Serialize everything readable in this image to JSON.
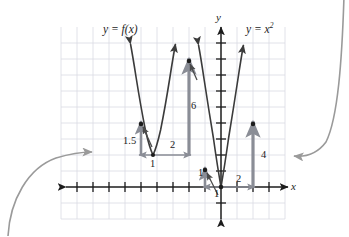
{
  "figure": {
    "kind": "math-graph",
    "background_color": "#ffffff",
    "grid_color": "#d9dbe3",
    "axis_color": "#1c1c1c",
    "curve_color": "#3b3b3b",
    "measure_color": "#8a8d96",
    "point_color": "#1c1c1c",
    "pointer_color": "#4a4a4a",
    "callout_color": "#9a9a9a"
  },
  "axes": {
    "x_label": "x",
    "y_label": "y",
    "origin_px": {
      "x": 221,
      "y": 187
    },
    "unit_px": 16,
    "x_range_px": {
      "from": 66,
      "to": 288
    },
    "y_range_px": {
      "from": 27,
      "to": 219
    },
    "tick_count_x": 14,
    "tick_count_y": 11,
    "grid": true
  },
  "curves": [
    {
      "name": "y = f(x)",
      "label": "y = f(x)",
      "label_plain": "y = f(x)",
      "color": "#3b3b3b",
      "vertex_px": {
        "x": 153,
        "y": 155
      },
      "arrowheads": "both-ends-up"
    },
    {
      "name": "y = x^2",
      "label_prefix": "y = x",
      "label_exponent": "2",
      "label_plain": "y = x²",
      "color": "#3b3b3b",
      "vertex_px": {
        "x": 221,
        "y": 187
      },
      "arrowheads": "both-ends-up"
    }
  ],
  "measurements": [
    {
      "id": "rise-fx-left",
      "value": "1.5",
      "orientation": "vertical",
      "at_px": {
        "x": 141,
        "y": 124
      }
    },
    {
      "id": "run-fx",
      "value": "1",
      "orientation": "horizontal",
      "at_px": {
        "x": 153,
        "y": 155
      }
    },
    {
      "id": "run-fx-right",
      "value": "2",
      "orientation": "horizontal",
      "at_px": {
        "x": 186,
        "y": 155
      }
    },
    {
      "id": "rise-fx-right",
      "value": "6",
      "orientation": "vertical",
      "at_px": {
        "x": 189,
        "y": 61
      }
    },
    {
      "id": "rise-x2-left",
      "value": "1",
      "orientation": "vertical",
      "at_px": {
        "x": 205,
        "y": 170
      }
    },
    {
      "id": "run-x2-left",
      "value": "1",
      "orientation": "horizontal",
      "at_px": {
        "x": 221,
        "y": 187
      }
    },
    {
      "id": "run-x2-right",
      "value": "2",
      "orientation": "horizontal",
      "at_px": {
        "x": 253,
        "y": 187
      }
    },
    {
      "id": "rise-x2-right",
      "value": "4",
      "orientation": "vertical",
      "at_px": {
        "x": 253,
        "y": 124
      }
    }
  ],
  "marked_points": [
    {
      "curve": "y = f(x)",
      "px": {
        "x": 141,
        "y": 124
      }
    },
    {
      "curve": "y = f(x)",
      "px": {
        "x": 153,
        "y": 155
      }
    },
    {
      "curve": "y = f(x)",
      "px": {
        "x": 189,
        "y": 61
      }
    },
    {
      "curve": "y = x^2",
      "px": {
        "x": 205,
        "y": 170
      }
    },
    {
      "curve": "y = x^2",
      "px": {
        "x": 221,
        "y": 187
      }
    },
    {
      "curve": "y = x^2",
      "px": {
        "x": 253,
        "y": 124
      }
    }
  ],
  "callout_arrows": [
    {
      "id": "left-callout",
      "points_to_px": {
        "x": 94,
        "y": 153
      },
      "from": "bottom-left",
      "color": "#9a9a9a"
    },
    {
      "id": "right-callout",
      "points_to_px": {
        "x": 290,
        "y": 156
      },
      "from": "top-right",
      "color": "#9a9a9a"
    }
  ],
  "pointer_arrows": [
    {
      "id": "pointer-to-fx-point",
      "target_px": {
        "x": 141,
        "y": 124
      }
    },
    {
      "id": "pointer-to-fx-top",
      "target_px": {
        "x": 189,
        "y": 61
      }
    },
    {
      "id": "pointer-to-x2-point",
      "target_px": {
        "x": 205,
        "y": 170
      }
    }
  ]
}
